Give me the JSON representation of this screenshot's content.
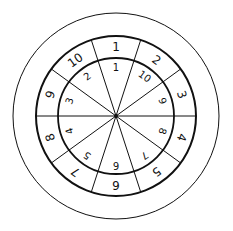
{
  "diagram": {
    "type": "concentric-number-wheel",
    "center": [
      116,
      116
    ],
    "radii": {
      "outer": 103,
      "middle": 80,
      "inner": 58
    },
    "segments": 10,
    "colors": {
      "stroke": "#111111",
      "background": "#ffffff"
    },
    "outer_ring_labels": [
      "1",
      "2",
      "3",
      "4",
      "5",
      "6",
      "7",
      "8",
      "9",
      "10"
    ],
    "inner_ring_labels": [
      "1",
      "10",
      "9",
      "8",
      "7",
      "6",
      "5",
      "4",
      "3",
      "2"
    ]
  }
}
